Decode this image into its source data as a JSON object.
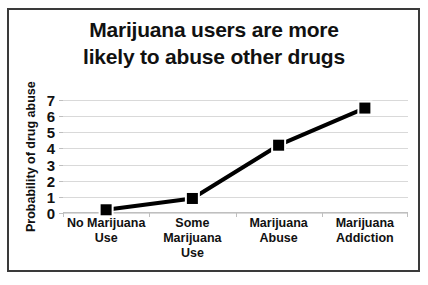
{
  "chart_data": {
    "type": "line",
    "title": "Marijuana users are more likely to abuse other drugs",
    "title_lines": [
      "Marijuana users are more",
      "likely to abuse other drugs"
    ],
    "xlabel": "",
    "ylabel": "Probability of drug abuse",
    "categories": [
      "No Marijuana Use",
      "Some Marijuana Use",
      "Marijuana Abuse",
      "Marijuana Addiction"
    ],
    "category_lines": [
      [
        "No Marijuana",
        "Use"
      ],
      [
        "Some",
        "Marijuana",
        "Use"
      ],
      [
        "Marijuana",
        "Abuse"
      ],
      [
        "Marijuana",
        "Addiction"
      ]
    ],
    "values": [
      0.2,
      0.9,
      4.2,
      6.5
    ],
    "ylim": [
      0,
      7
    ],
    "yticks": [
      0,
      1,
      2,
      3,
      4,
      5,
      6,
      7
    ],
    "ytick_labels": [
      "0",
      "1",
      "2",
      "3",
      "4",
      "5",
      "6",
      "7"
    ],
    "grid": true,
    "legend": false,
    "series_color": "#000000",
    "marker": "square",
    "line_width": 4,
    "gridline_color": "#d9d9d9",
    "background_color": "#ffffff",
    "border_color": "#3a3a3a"
  }
}
